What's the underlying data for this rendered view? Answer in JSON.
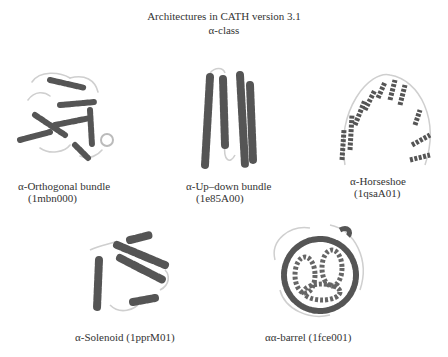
{
  "header": {
    "title": "Architectures in CATH version 3.1",
    "subtitle": "α-class"
  },
  "colors": {
    "helix": "#555555",
    "helix_shade": "#7a7a7a",
    "loop": "#cfcfcf",
    "text": "#333333",
    "background": "#ffffff"
  },
  "architectures": [
    {
      "name": "α-Orthogonal bundle",
      "pdb_id": "(1mbn000)"
    },
    {
      "name": "α-Up–down bundle",
      "pdb_id": "(1e85A00)"
    },
    {
      "name": "α-Horseshoe",
      "pdb_id": "(1qsaA01)"
    },
    {
      "name": "α-Solenoid",
      "pdb_id": "(1pprM01)"
    },
    {
      "name": "αα-barrel",
      "pdb_id": "(1fce001)"
    }
  ]
}
